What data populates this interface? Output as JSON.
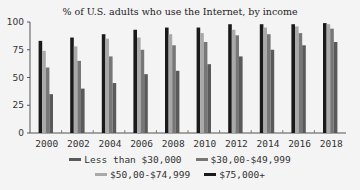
{
  "chart_data": {
    "type": "bar",
    "title": "% of U.S. adults who use the Internet, by income",
    "xlabel": "",
    "ylabel": "",
    "ylim": [
      0,
      100
    ],
    "yticks": [
      0,
      25,
      50,
      75,
      100
    ],
    "grid": false,
    "legend_position": "bottom",
    "categories": [
      "2000",
      "2002",
      "2004",
      "2006",
      "2008",
      "2010",
      "2012",
      "2014",
      "2016",
      "2018"
    ],
    "series": [
      {
        "name": "$75,000+",
        "color": "#1a1a1a",
        "values": [
          83,
          86,
          89,
          93,
          95,
          95,
          98,
          98,
          98,
          99
        ]
      },
      {
        "name": "$50,00-$74,999",
        "color": "#a9a9a9",
        "values": [
          74,
          78,
          85,
          86,
          89,
          90,
          93,
          95,
          96,
          98
        ]
      },
      {
        "name": "$30,00-$49,999",
        "color": "#777777",
        "values": [
          59,
          65,
          69,
          75,
          79,
          82,
          88,
          89,
          90,
          94
        ]
      },
      {
        "name": "Less than $30,000",
        "color": "#5a5a5a",
        "values": [
          35,
          40,
          45,
          53,
          56,
          62,
          69,
          75,
          79,
          82
        ]
      }
    ]
  },
  "legend": {
    "row1": [
      {
        "label": "Less than $30,000",
        "color": "#5a5a5a"
      },
      {
        "label": "$30,00-$49,999",
        "color": "#777777"
      }
    ],
    "row2": [
      {
        "label": "$50,00-$74,999",
        "color": "#a9a9a9"
      },
      {
        "label": "$75,000+",
        "color": "#1a1a1a"
      }
    ]
  }
}
